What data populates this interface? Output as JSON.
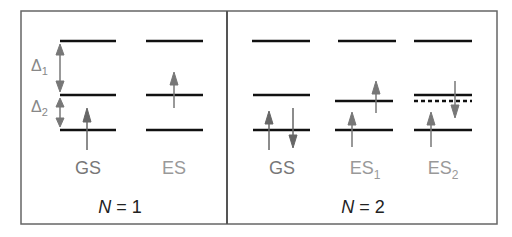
{
  "panels": [
    {
      "title_var": "N",
      "title_rest": " = 1",
      "states": [
        "GS",
        "ES"
      ],
      "gap_labels": [
        {
          "sym": "Δ",
          "sub": "1"
        },
        {
          "sym": "Δ",
          "sub": "2"
        }
      ]
    },
    {
      "title_var": "N",
      "title_rest": " = 2",
      "states": [
        {
          "base": "GS",
          "sub": ""
        },
        {
          "base": "ES",
          "sub": "1"
        },
        {
          "base": "ES",
          "sub": "2"
        }
      ]
    }
  ],
  "colors": {
    "level_line": "#111111",
    "arrow": "#6e6e6e",
    "frame": "#555555",
    "label_text": "#707070"
  }
}
